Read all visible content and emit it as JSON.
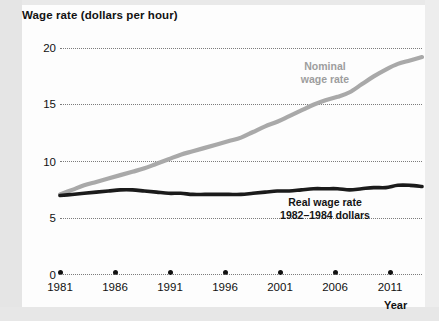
{
  "chart_data": {
    "type": "line",
    "title": "Wage rate (dollars per hour)",
    "xlabel": "Year",
    "ylabel": "Wage rate (dollars per hour)",
    "xlim": [
      1981,
      2011
    ],
    "ylim": [
      0,
      20
    ],
    "grid": true,
    "grid_style": "dotted horizontal",
    "legend_position": "inline annotations",
    "yticks": [
      0,
      5,
      10,
      15,
      20
    ],
    "ytick_labels": [
      "0",
      "5",
      "10",
      "15",
      "20"
    ],
    "xticks": [
      1981,
      1986,
      1991,
      1996,
      2001,
      2006,
      2011
    ],
    "xtick_labels": [
      "1981",
      "1986",
      "1991",
      "1996",
      "2001",
      "2006",
      "2011"
    ],
    "x": [
      1981,
      1982,
      1983,
      1984,
      1985,
      1986,
      1987,
      1988,
      1989,
      1990,
      1991,
      1992,
      1993,
      1994,
      1995,
      1996,
      1997,
      1998,
      1999,
      2000,
      2001,
      2002,
      2003,
      2004,
      2005,
      2006,
      2007,
      2008,
      2009,
      2010,
      2011
    ],
    "series": [
      {
        "name": "Nominal wage rate",
        "color": "#a9a9a9",
        "label_text": "Nominal\nwage rate",
        "values": [
          7.1,
          7.5,
          7.9,
          8.2,
          8.5,
          8.8,
          9.1,
          9.4,
          9.8,
          10.2,
          10.6,
          10.9,
          11.2,
          11.5,
          11.8,
          12.1,
          12.6,
          13.1,
          13.5,
          14.0,
          14.5,
          15.0,
          15.4,
          15.7,
          16.1,
          16.8,
          17.5,
          18.1,
          18.6,
          18.9,
          19.2
        ]
      },
      {
        "name": "Real wage rate",
        "color": "#1b1b1b",
        "label_text": "Real wage rate\n1982–1984 dollars",
        "units": "1982–1984 dollars",
        "values": [
          7.0,
          7.1,
          7.2,
          7.3,
          7.4,
          7.5,
          7.5,
          7.4,
          7.3,
          7.2,
          7.2,
          7.1,
          7.1,
          7.1,
          7.1,
          7.1,
          7.2,
          7.3,
          7.4,
          7.4,
          7.5,
          7.6,
          7.6,
          7.6,
          7.5,
          7.6,
          7.7,
          7.7,
          7.9,
          7.9,
          7.8
        ]
      }
    ],
    "annotations": [
      {
        "name": "nominal-wage-rate-label",
        "line1": "Nominal",
        "line2": "wage rate"
      },
      {
        "name": "real-wage-rate-label",
        "line1": "Real wage rate",
        "line2": "1982–1984 dollars"
      }
    ]
  }
}
